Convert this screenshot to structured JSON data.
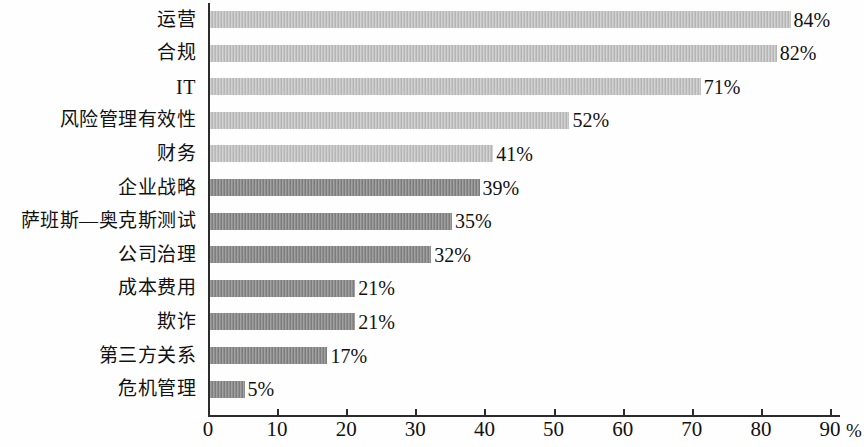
{
  "chart_data": {
    "type": "bar",
    "orientation": "horizontal",
    "title": "",
    "subtitle": "",
    "xlabel": "%",
    "ylabel": "",
    "xlim": [
      0,
      90
    ],
    "xticks": [
      "0",
      "10",
      "20",
      "30",
      "40",
      "50",
      "60",
      "70",
      "80",
      "90"
    ],
    "xtick_values": [
      0,
      10,
      20,
      30,
      40,
      50,
      60,
      70,
      80,
      90
    ],
    "grid": false,
    "legend": false,
    "axis_unit": "%",
    "categories": [
      "运营",
      "合规",
      "IT",
      "风险管理有效性",
      "财务",
      "企业战略",
      "萨班斯—奥克斯测试",
      "公司治理",
      "成本费用",
      "欺诈",
      "第三方关系",
      "危机管理"
    ],
    "values": [
      84,
      82,
      71,
      52,
      41,
      39,
      35,
      32,
      21,
      21,
      17,
      5
    ],
    "value_labels": [
      "84%",
      "82%",
      "71%",
      "52%",
      "41%",
      "39%",
      "35%",
      "32%",
      "21%",
      "21%",
      "17%",
      "5%"
    ],
    "bar_styles": [
      "light",
      "light",
      "light",
      "light",
      "light",
      "dark",
      "dark",
      "dark",
      "dark",
      "dark",
      "dark",
      "dark"
    ],
    "colors": {
      "bar_light": "#bfbfbf",
      "bar_dark": "#868686",
      "axis": "#2b2b2b",
      "text": "#111111",
      "background": "#fefefe"
    }
  }
}
